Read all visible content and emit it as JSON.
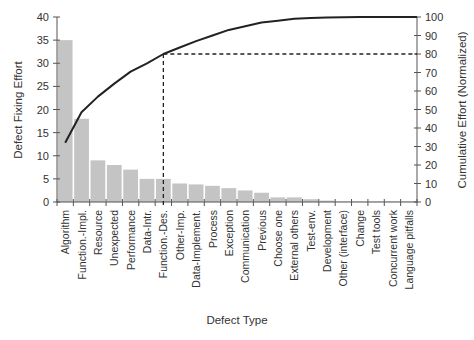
{
  "chart_data": {
    "type": "bar",
    "subtype": "pareto",
    "title": "",
    "xlabel": "Defect Type",
    "ylabel": "Defect Fixing Effort",
    "y2label": "Cumulative Effort (Normalized)",
    "ylim": [
      0,
      40
    ],
    "y2lim": [
      0,
      100
    ],
    "yticks": [
      0,
      5,
      10,
      15,
      20,
      25,
      30,
      35,
      40
    ],
    "y2ticks": [
      0,
      10,
      20,
      30,
      40,
      50,
      60,
      70,
      80,
      90,
      100
    ],
    "grid": false,
    "legend": null,
    "categories": [
      "Algorithm",
      "Function.-Impl.",
      "Resource",
      "Unexpected",
      "Performance",
      "Data-Intr.",
      "Function.-Des.",
      "Other-Imp.",
      "Data-Implement.",
      "Process",
      "Exception",
      "Communication",
      "Previous",
      "Choose one",
      "External others",
      "Test-env.",
      "Development",
      "Other (interface)",
      "Change",
      "Test tools",
      "Concurrent work",
      "Language pitfalls"
    ],
    "series": [
      {
        "name": "Defect Fixing Effort",
        "type": "bar",
        "axis": "left",
        "color": "#c4c4c4",
        "values": [
          35,
          18,
          9,
          8,
          7,
          5,
          5,
          4,
          3.8,
          3.5,
          3,
          2.5,
          2,
          1,
          1,
          0.6,
          0.3,
          0.1,
          0.1,
          0.1,
          0.1,
          0.1
        ]
      },
      {
        "name": "Cumulative Effort (Normalized)",
        "type": "line",
        "axis": "right",
        "color": "#222222",
        "values": [
          32,
          48.5,
          57,
          64,
          70.5,
          75,
          80,
          83.5,
          87,
          90,
          93,
          95,
          97,
          98,
          99,
          99.5,
          99.8,
          99.9,
          100,
          100,
          100,
          100
        ]
      }
    ],
    "annotations": [
      {
        "type": "dashed-line",
        "description": "80% cutoff",
        "at_category": "Function.-Des.",
        "y2_value": 80
      }
    ]
  }
}
